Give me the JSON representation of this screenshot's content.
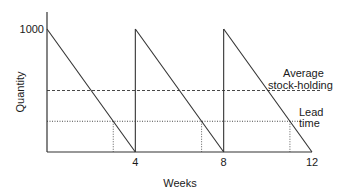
{
  "chart_data": {
    "type": "line",
    "title": "",
    "xlabel": "Weeks",
    "ylabel": "Quantity",
    "xlim": [
      0,
      12
    ],
    "ylim": [
      0,
      1000
    ],
    "x_ticks": [
      4,
      8,
      12
    ],
    "x_tick_labels": [
      "4",
      "8",
      "12"
    ],
    "y_ticks": [
      1000
    ],
    "y_tick_labels": [
      "1000"
    ],
    "grid": false,
    "series": [
      {
        "name": "Stock level",
        "style": "solid",
        "x": [
          0,
          4,
          4,
          8,
          8,
          12
        ],
        "y": [
          1000,
          0,
          1000,
          0,
          1000,
          0
        ]
      }
    ],
    "reference_lines": [
      {
        "name": "Average stock-holding",
        "orientation": "horizontal",
        "value": 500,
        "style": "dashed",
        "label": [
          "Average",
          "stock-holding"
        ]
      },
      {
        "name": "Lead time",
        "orientation": "horizontal",
        "value": 250,
        "style": "dotted",
        "label": [
          "Lead",
          "time"
        ]
      }
    ],
    "reorder_points": [
      3,
      7,
      11
    ],
    "colors": {
      "line": "#333333",
      "axis": "#333333"
    }
  }
}
